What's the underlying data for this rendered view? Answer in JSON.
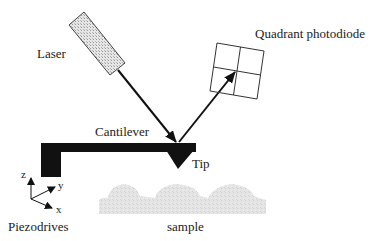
{
  "diagram": {
    "type": "schematic",
    "labels": {
      "laser": "Laser",
      "photodiode": "Quadrant photodiode",
      "cantilever": "Cantilever",
      "tip": "Tip",
      "sample": "sample",
      "piezodrives": "Piezodrives",
      "axis_x": "x",
      "axis_y": "y",
      "axis_z": "z"
    },
    "components": [
      {
        "id": "laser",
        "shape": "hatched-rectangle",
        "label": "Laser"
      },
      {
        "id": "laser-beam",
        "shape": "line",
        "from": "laser",
        "to": "tip"
      },
      {
        "id": "reflected-beam",
        "shape": "arrow",
        "from": "tip",
        "to": "photodiode"
      },
      {
        "id": "photodiode",
        "shape": "2x2-grid",
        "label": "Quadrant photodiode"
      },
      {
        "id": "cantilever",
        "shape": "L-bar",
        "label": "Cantilever"
      },
      {
        "id": "tip",
        "shape": "triangle",
        "label": "Tip"
      },
      {
        "id": "sample",
        "shape": "bumpy-surface",
        "label": "sample"
      },
      {
        "id": "axes",
        "shape": "xyz-triad",
        "label": "Piezodrives"
      }
    ],
    "colors": {
      "ink": "#111111",
      "text": "#222222",
      "laser_fill": "#d8d8d8",
      "sample_fill": "#e2e2e2"
    }
  }
}
